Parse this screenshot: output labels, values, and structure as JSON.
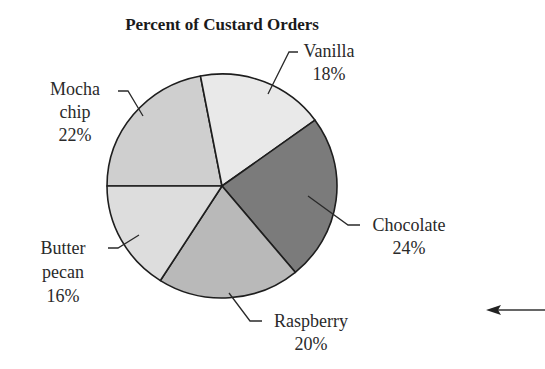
{
  "chart_data": {
    "type": "pie",
    "title": "Percent of Custard Orders",
    "categories": [
      "Vanilla",
      "Chocolate",
      "Raspberry",
      "Butter pecan",
      "Mocha chip"
    ],
    "values": [
      18,
      24,
      20,
      16,
      22
    ],
    "unit": "%",
    "slices": [
      {
        "name": "Mocha chip",
        "value": 22,
        "label_lines": [
          "Mocha",
          "chip",
          "22%"
        ],
        "color": "#cfcfcf"
      },
      {
        "name": "Vanilla",
        "value": 18,
        "label_lines": [
          "Vanilla",
          "18%"
        ],
        "color": "#e9e9e9"
      },
      {
        "name": "Chocolate",
        "value": 24,
        "label_lines": [
          "Chocolate",
          "24%"
        ],
        "color": "#7b7b7b"
      },
      {
        "name": "Raspberry",
        "value": 20,
        "label_lines": [
          "Raspberry",
          "20%"
        ],
        "color": "#b9b9b9"
      },
      {
        "name": "Butter pecan",
        "value": 16,
        "label_lines": [
          "Butter",
          "pecan",
          "16%"
        ],
        "color": "#dddddd"
      }
    ],
    "legend": "none",
    "grid": false
  },
  "annotations": {
    "arrow": "left-pointing arrow"
  }
}
